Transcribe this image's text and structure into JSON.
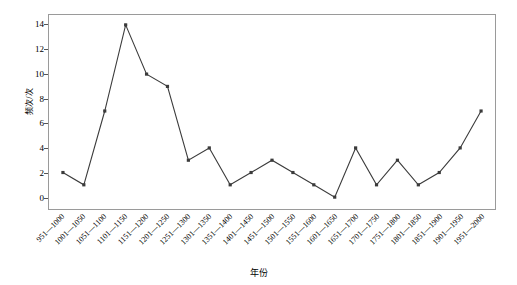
{
  "chart_data": {
    "type": "line",
    "title": "",
    "xlabel": "年份",
    "ylabel": "频次/次",
    "ylim": [
      0,
      14
    ],
    "yticks": [
      0,
      2,
      4,
      6,
      8,
      10,
      12,
      14
    ],
    "grid": false,
    "legend": "none",
    "marker": "square",
    "line_color": "#3b3b3b",
    "marker_color": "#3b3b3b",
    "categories": [
      "951—1000",
      "1001—1050",
      "1051—1100",
      "1101—1150",
      "1151—1200",
      "1201—1250",
      "1251—1300",
      "1301—1350",
      "1351—1400",
      "1401—1450",
      "1451—1500",
      "1501—1550",
      "1551—1600",
      "1601—1650",
      "1651—1700",
      "1701—1750",
      "1751—1800",
      "1801—1850",
      "1851—1900",
      "1901—1950",
      "1951—2000"
    ],
    "values": [
      2,
      1,
      7,
      14,
      10,
      9,
      3,
      4,
      1,
      2,
      3,
      2,
      1,
      0,
      4,
      1,
      3,
      1,
      2,
      4,
      7
    ]
  }
}
